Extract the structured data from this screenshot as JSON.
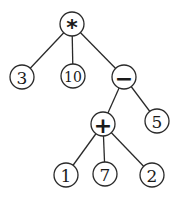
{
  "diagram": {
    "type": "expression-tree",
    "colors": {
      "stroke": "#2a2a2a",
      "fill": "#ffffff",
      "text": "#1a1a1a"
    },
    "radius": 12,
    "nodes": [
      {
        "id": "root",
        "label": "*",
        "kind": "operator",
        "x": 72,
        "y": 24
      },
      {
        "id": "n3",
        "label": "3",
        "kind": "operand",
        "x": 22,
        "y": 77
      },
      {
        "id": "n10",
        "label": "10",
        "kind": "operand",
        "x": 73,
        "y": 76
      },
      {
        "id": "minus",
        "label": "−",
        "kind": "operator",
        "x": 124,
        "y": 77
      },
      {
        "id": "plus",
        "label": "+",
        "kind": "operator",
        "x": 103,
        "y": 124
      },
      {
        "id": "n5",
        "label": "5",
        "kind": "operand",
        "x": 157,
        "y": 121
      },
      {
        "id": "n1",
        "label": "1",
        "kind": "operand",
        "x": 66,
        "y": 175
      },
      {
        "id": "n7",
        "label": "7",
        "kind": "operand",
        "x": 105,
        "y": 174
      },
      {
        "id": "n2",
        "label": "2",
        "kind": "operand",
        "x": 152,
        "y": 175
      }
    ],
    "edges": [
      [
        "root",
        "n3"
      ],
      [
        "root",
        "n10"
      ],
      [
        "root",
        "minus"
      ],
      [
        "minus",
        "plus"
      ],
      [
        "minus",
        "n5"
      ],
      [
        "plus",
        "n1"
      ],
      [
        "plus",
        "n7"
      ],
      [
        "plus",
        "n2"
      ]
    ]
  }
}
